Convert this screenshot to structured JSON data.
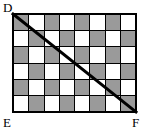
{
  "figure": {
    "type": "geometry-diagram",
    "labels": {
      "top_left": "D",
      "bottom_left": "E",
      "bottom_right": "F"
    },
    "grid": {
      "columns": 8,
      "rows": 6,
      "shaded_color": "#9a9a9a",
      "unshaded_color": "#ffffff",
      "line_color": "#000000",
      "border_width_px": 2,
      "pattern_note": "alternating checkerboard, row 1 starts shaded",
      "pattern": [
        [
          1,
          0,
          1,
          0,
          1,
          0,
          1,
          0
        ],
        [
          0,
          1,
          0,
          1,
          0,
          1,
          0,
          1
        ],
        [
          1,
          0,
          1,
          0,
          1,
          0,
          1,
          0
        ],
        [
          0,
          1,
          0,
          1,
          0,
          1,
          0,
          1
        ],
        [
          1,
          0,
          1,
          0,
          1,
          0,
          1,
          0
        ],
        [
          0,
          1,
          0,
          1,
          0,
          1,
          0,
          1
        ]
      ]
    },
    "diagonal": {
      "from": "D",
      "to": "F",
      "color": "#000000",
      "width_px": 3
    }
  }
}
